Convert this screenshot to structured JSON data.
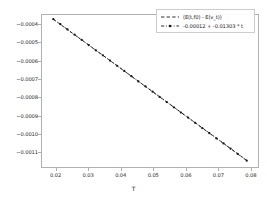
{
  "figure": {
    "background_color": "#ffffff",
    "line_color": "#1a1a1a",
    "frame_color": "#b0b0b0"
  },
  "axes": {
    "xlabel": "T",
    "ylabel": "",
    "xticks": [
      "0.02",
      "0.03",
      "0.04",
      "0.05",
      "0.06",
      "0.07",
      "0.08"
    ],
    "yticks": [
      "-0.0004",
      "-0.0005",
      "-0.0006",
      "-0.0007",
      "-0.0008",
      "-0.0009",
      "-0.0010",
      "-0.0011"
    ]
  },
  "legend": {
    "entries": [
      {
        "label": "(E(t,f0) - E(v_t))",
        "style": "dashed",
        "marker": "none"
      },
      {
        "label": "-0.00012 + -0.01303 * t",
        "style": "dash-dot",
        "marker": "dot"
      }
    ]
  },
  "chart_data": {
    "type": "line",
    "title": "",
    "xlabel": "T",
    "ylabel": "",
    "xlim": [
      0.0155,
      0.0825
    ],
    "ylim": [
      -0.001185,
      -0.000345
    ],
    "grid": false,
    "legend_position": "upper right",
    "series": [
      {
        "name": "(E(t,f0) - E(v_t))",
        "style": "dashed",
        "marker": "none",
        "x": [
          0.019,
          0.0212,
          0.0234,
          0.0256,
          0.0278,
          0.03,
          0.0322,
          0.0344,
          0.0366,
          0.0388,
          0.041,
          0.0432,
          0.0454,
          0.0476,
          0.0498,
          0.052,
          0.0542,
          0.0564,
          0.0586,
          0.0608,
          0.063,
          0.0652,
          0.0674,
          0.0696,
          0.0718,
          0.074,
          0.0762,
          0.079
        ],
        "y": [
          -0.000368,
          -0.000397,
          -0.000426,
          -0.000454,
          -0.000483,
          -0.000511,
          -0.00054,
          -0.000568,
          -0.000597,
          -0.000625,
          -0.000654,
          -0.000683,
          -0.000711,
          -0.00074,
          -0.000768,
          -0.000797,
          -0.000825,
          -0.000854,
          -0.000883,
          -0.000911,
          -0.00094,
          -0.000968,
          -0.000997,
          -0.001025,
          -0.001054,
          -0.001083,
          -0.001111,
          -0.001148
        ]
      },
      {
        "name": "-0.00012 + -0.01303 * t",
        "style": "dash-dot",
        "marker": "dot",
        "intercept": -0.00012,
        "slope": -0.01303,
        "x": [
          0.019,
          0.0212,
          0.0234,
          0.0256,
          0.0278,
          0.03,
          0.0322,
          0.0344,
          0.0366,
          0.0388,
          0.041,
          0.0432,
          0.0454,
          0.0476,
          0.0498,
          0.052,
          0.0542,
          0.0564,
          0.0586,
          0.0608,
          0.063,
          0.0652,
          0.0674,
          0.0696,
          0.0718,
          0.074,
          0.0762,
          0.079
        ],
        "y": [
          -0.000368,
          -0.000396,
          -0.000425,
          -0.000454,
          -0.000482,
          -0.000511,
          -0.00054,
          -0.000568,
          -0.000597,
          -0.000626,
          -0.000654,
          -0.000683,
          -0.000712,
          -0.00074,
          -0.000769,
          -0.000798,
          -0.000826,
          -0.000855,
          -0.000884,
          -0.000912,
          -0.000941,
          -0.00097,
          -0.000998,
          -0.001027,
          -0.001055,
          -0.001084,
          -0.001113,
          -0.00115
        ]
      }
    ]
  }
}
